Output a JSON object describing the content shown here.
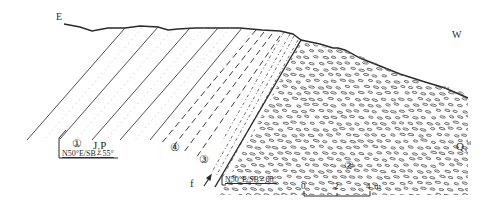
{
  "diagram": {
    "type": "geological cross-section",
    "directions": {
      "left": "E",
      "right": "W"
    },
    "units": {
      "bedrock": {
        "main": "J",
        "sub": "1",
        "suffix": "P"
      },
      "quaternary": {
        "main": "Q",
        "sub": "3",
        "sup": "el"
      }
    },
    "layer_markers": [
      "①",
      "②",
      "③",
      "④"
    ],
    "attitudes": [
      {
        "id": "bedding",
        "text": "N50°E/SB∠55°"
      },
      {
        "id": "fault",
        "text": "N50°E/SB∠60°"
      }
    ],
    "fault": {
      "label": "f"
    },
    "scale_bar": {
      "ticks": [
        "0",
        "2",
        "4"
      ],
      "unit": "m"
    },
    "colors": {
      "ink": "#2a2a2a",
      "dots": "#9a9a9a",
      "background": "#ffffff"
    }
  }
}
